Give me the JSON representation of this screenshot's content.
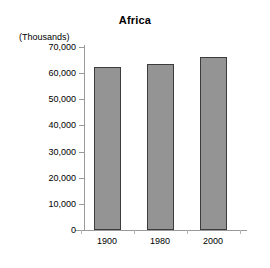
{
  "chart_data": {
    "type": "bar",
    "title": "Africa",
    "xlabel": "",
    "ylabel": "(Thousands)",
    "categories": [
      "1900",
      "1980",
      "2000"
    ],
    "values": [
      62500,
      63500,
      66000
    ],
    "ylim": [
      0,
      70000
    ],
    "ytick_labels": [
      "70,000",
      "60,000",
      "50,000",
      "40,000",
      "30,000",
      "20,000",
      "10,000",
      "0"
    ],
    "ytick_values": [
      70000,
      60000,
      50000,
      40000,
      30000,
      20000,
      10000,
      0
    ],
    "grid": false,
    "legend": false,
    "bar_color": "#949494",
    "bar_border_color": "#3c3c3c",
    "axis_color": "#9a9a9a",
    "background": "#ffffff"
  }
}
